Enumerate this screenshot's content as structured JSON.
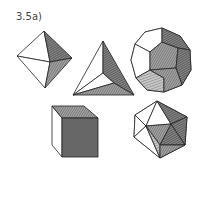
{
  "figure": {
    "label": "3.5a)",
    "shapes": [
      {
        "name": "octahedron",
        "position": "top-left"
      },
      {
        "name": "tetrahedron",
        "position": "top-center"
      },
      {
        "name": "dodecahedron",
        "position": "top-right"
      },
      {
        "name": "cube",
        "position": "bottom-left"
      },
      {
        "name": "icosahedron",
        "position": "bottom-right"
      }
    ],
    "colors": {
      "line": "#222222",
      "shade": "#555555",
      "background": "#ffffff"
    }
  }
}
